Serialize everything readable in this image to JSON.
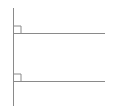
{
  "diagram": {
    "stroke_color": "#8a8a8a",
    "vertical_line": {
      "x": 13.5,
      "y1": 8,
      "y2": 106
    },
    "horizontal_lines": [
      {
        "y": 33.5,
        "x1": 13.5,
        "x2": 105,
        "right_angle_marker": {
          "x": 13.5,
          "y": 26,
          "size": 7.5
        }
      },
      {
        "y": 81.5,
        "x1": 13.5,
        "x2": 105,
        "right_angle_marker": {
          "x": 13.5,
          "y": 74,
          "size": 7.5
        }
      }
    ]
  }
}
